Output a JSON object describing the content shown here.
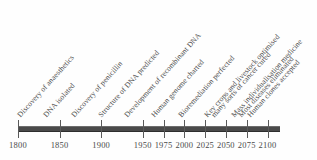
{
  "chart_data": {
    "type": "timeline",
    "title": "",
    "xlabel": "",
    "ylabel": "",
    "grid": false,
    "legend": false,
    "axis_years": [
      1800,
      1850,
      1900,
      1950,
      1975,
      2000,
      2025,
      2050,
      2075,
      2100
    ],
    "axis_tick_labels": [
      "1800",
      "1850",
      "1900",
      "1950",
      "1975",
      "2000",
      "2025",
      "2050",
      "2075",
      "2100"
    ],
    "axis_range": [
      1800,
      2115
    ],
    "events": [
      {
        "label": "Discovery of anaesthetics",
        "year": 1800,
        "x": 22
      },
      {
        "label": "DNA isolated",
        "year": 1850,
        "x": 48
      },
      {
        "label": "Discovery of penicillin",
        "year": 1900,
        "x": 76
      },
      {
        "label": "Structure of DNA predicted",
        "year": 1950,
        "x": 103
      },
      {
        "label": "Development of recombinant DNA",
        "year": 1975,
        "x": 129
      },
      {
        "label": "Human genome charted",
        "year": 2000,
        "x": 156
      },
      {
        "label": "Bioremediation perfected",
        "year": 2025,
        "x": 183
      },
      {
        "label": "Key crops and livestock optimised",
        "year": 2050,
        "x": 209
      },
      {
        "label": "many sorts of cancer cured",
        "year": 2050,
        "x": 216
      },
      {
        "label": "Mass individualisation medicine",
        "year": 2075,
        "x": 236
      },
      {
        "label": "Most diseases eliminated",
        "year": 2090,
        "x": 243
      },
      {
        "label": "Human clones accepted",
        "year": 2100,
        "x": 252
      }
    ],
    "colors": {
      "bar": "#4a4a4a",
      "tick": "#5a5a5a",
      "text": "#4a4a4a",
      "background": "#fefefe"
    }
  }
}
